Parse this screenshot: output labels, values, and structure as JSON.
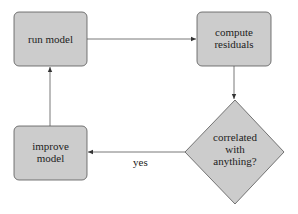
{
  "diagram": {
    "type": "flowchart",
    "colors": {
      "node_fill": "#cccccc",
      "node_stroke": "#555555",
      "edge": "#444444",
      "background": "#ffffff"
    },
    "nodes": [
      {
        "id": "run",
        "shape": "rounded-rect",
        "lines": [
          "run model"
        ]
      },
      {
        "id": "compute",
        "shape": "rounded-rect",
        "lines": [
          "compute",
          "residuals"
        ]
      },
      {
        "id": "decide",
        "shape": "diamond",
        "lines": [
          "correlated",
          "with",
          "anything?"
        ]
      },
      {
        "id": "improve",
        "shape": "rounded-rect",
        "lines": [
          "improve",
          "model"
        ]
      }
    ],
    "edges": [
      {
        "from": "run",
        "to": "compute",
        "label": ""
      },
      {
        "from": "compute",
        "to": "decide",
        "label": ""
      },
      {
        "from": "decide",
        "to": "improve",
        "label": "yes"
      },
      {
        "from": "improve",
        "to": "run",
        "label": ""
      }
    ]
  }
}
